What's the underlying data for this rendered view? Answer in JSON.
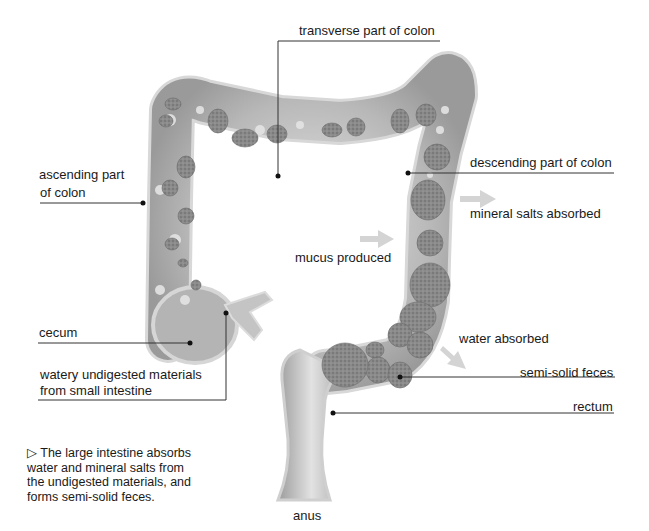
{
  "diagram": {
    "title": "Large intestine",
    "labels": {
      "transverse": "transverse part of colon",
      "ascending_line1": "ascending part",
      "ascending_line2": "of colon",
      "descending": "descending part of colon",
      "mineral": "mineral salts absorbed",
      "mucus": "mucus produced",
      "cecum": "cecum",
      "watery_line1": "watery undigested materials",
      "watery_line2": "from small intestine",
      "water_absorbed": "water absorbed",
      "semi_solid": "semi-solid feces",
      "rectum": "rectum",
      "anus": "anus"
    },
    "caption": {
      "marker": "▷",
      "line1": "The large intestine absorbs",
      "line2": "water and mineral salts from",
      "line3": "the undigested materials, and",
      "line4": "forms semi-solid feces."
    },
    "colors": {
      "colon_fill": "#b9b9b9",
      "colon_edge": "#d6d6d6",
      "feces": "#7a7a7a",
      "arrow": "#d4d4d4",
      "leader_line": "#333333"
    }
  }
}
